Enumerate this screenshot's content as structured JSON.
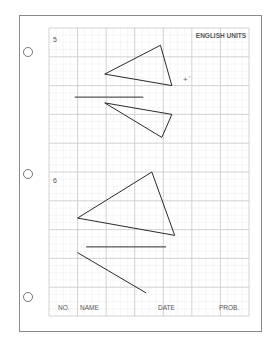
{
  "worksheet": {
    "header_label": "ENGLISH UNITS",
    "problems": [
      {
        "number": "5",
        "shapes": [
          {
            "type": "triangle",
            "name": "problem-5-triangle-upper",
            "points": [
              [
                3.9,
                0.6
              ],
              [
                1.95,
                1.6
              ],
              [
                4.3,
                2.0
              ]
            ]
          },
          {
            "type": "line",
            "name": "problem-5-divider-line",
            "points": [
              [
                0.9,
                2.4
              ],
              [
                3.3,
                2.4
              ]
            ]
          },
          {
            "type": "triangle",
            "name": "problem-5-triangle-lower",
            "points": [
              [
                1.95,
                2.6
              ],
              [
                4.3,
                3.0
              ],
              [
                3.95,
                3.8
              ]
            ]
          }
        ]
      },
      {
        "number": "6",
        "shapes": [
          {
            "type": "triangle",
            "name": "problem-6-triangle",
            "points": [
              [
                3.6,
                5.0
              ],
              [
                1.0,
                6.6
              ],
              [
                4.4,
                7.2
              ]
            ]
          },
          {
            "type": "line",
            "name": "problem-6-divider-line",
            "points": [
              [
                1.3,
                7.6
              ],
              [
                4.1,
                7.6
              ]
            ]
          },
          {
            "type": "line",
            "name": "problem-6-diagonal-line",
            "points": [
              [
                1.0,
                7.8
              ],
              [
                3.4,
                9.2
              ]
            ]
          }
        ]
      }
    ],
    "marker": {
      "symbol": "+",
      "tick": "'",
      "name": "reference-cross-mark"
    },
    "footer": {
      "no_label": "NO.",
      "name_label": "NAME",
      "date_label": "DATE",
      "prob_label": "PROB."
    },
    "grid": {
      "major_columns": 7,
      "major_rows": 10,
      "minor_per_major": 4
    },
    "punch_holes": 3,
    "colors": {
      "major_grid": "#c8c8c8",
      "minor_grid": "#ececec",
      "ink": "#2a2a2a",
      "border": "#888888"
    }
  }
}
